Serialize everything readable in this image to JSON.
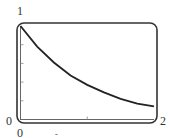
{
  "chart_data": {
    "type": "line",
    "title": "",
    "xlabel": "",
    "ylabel": "",
    "xlim": [
      0,
      2
    ],
    "ylim": [
      0,
      1
    ],
    "grid": false,
    "legend": null,
    "x_tick_labels": {
      "min": "0",
      "max": "2"
    },
    "y_tick_labels": {
      "min": "0",
      "max": "1"
    },
    "x_ticks": [
      1
    ],
    "y_ticks": [
      0.2,
      0.4,
      0.6,
      0.8
    ],
    "series": [
      {
        "name": "y = e^(-x)",
        "x": [
          0,
          0.25,
          0.5,
          0.75,
          1.0,
          1.25,
          1.5,
          1.75,
          2.0
        ],
        "values": [
          1.0,
          0.78,
          0.61,
          0.47,
          0.37,
          0.29,
          0.22,
          0.17,
          0.14
        ]
      }
    ],
    "colors": {
      "curve": "#222222",
      "frame": "#333333",
      "axes": "#555555"
    }
  },
  "labels": {
    "y_max": "1",
    "y_min": "0",
    "x_min": "0",
    "x_max": "2",
    "x_marker": "-"
  }
}
